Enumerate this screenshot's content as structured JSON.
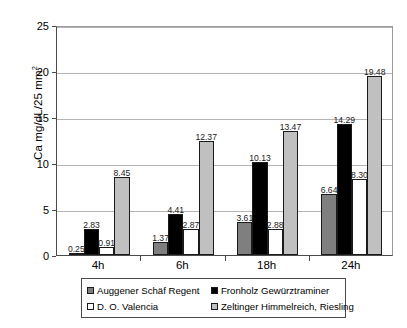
{
  "chart_data": {
    "type": "bar",
    "title": "",
    "xlabel": "",
    "ylabel": "Ca mg/dL/25 mm²",
    "ylabel_main": "Ca mg/dL/25 mm",
    "ylabel_sup": "2",
    "ylim": [
      0,
      25
    ],
    "yticks": [
      0,
      5,
      10,
      15,
      20,
      25
    ],
    "ytick_labels": [
      "0",
      "5",
      "10",
      "15",
      "20",
      "25"
    ],
    "grid": "horizontal",
    "legend_position": "below-axis",
    "categories": [
      "4h",
      "6h",
      "18h",
      "24h"
    ],
    "series": [
      {
        "name": "Auggener Schäf Regent",
        "color": "#7f7f7f",
        "values": [
          0.25,
          1.37,
          3.61,
          6.64
        ],
        "labels": [
          "0.25",
          "1.37",
          "3.61",
          "6.64"
        ]
      },
      {
        "name": "Fronholz Gewürztraminer",
        "color": "#000000",
        "values": [
          2.83,
          4.41,
          10.13,
          14.29
        ],
        "labels": [
          "2.83",
          "4.41",
          "10.13",
          "14.29"
        ]
      },
      {
        "name": "D. O. Valencia",
        "color": "#ffffff",
        "values": [
          0.91,
          2.87,
          2.88,
          8.3
        ],
        "labels": [
          "0.91",
          "2.87",
          "2.88",
          "8.30"
        ]
      },
      {
        "name": "Zeltinger Himmelreich, Riesling",
        "color": "#c0c0c0",
        "values": [
          8.45,
          12.37,
          13.47,
          19.48
        ],
        "labels": [
          "8.45",
          "12.37",
          "13.47",
          "19.48"
        ]
      }
    ]
  },
  "legend": {
    "items": [
      {
        "label": "Auggener Schäf Regent",
        "color": "#7f7f7f"
      },
      {
        "label": "Fronholz Gewürztraminer",
        "color": "#000000"
      },
      {
        "label": "D. O. Valencia",
        "color": "#ffffff"
      },
      {
        "label": "Zeltinger Himmelreich, Riesling",
        "color": "#c0c0c0"
      }
    ]
  }
}
